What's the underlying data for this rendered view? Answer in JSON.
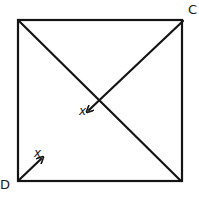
{
  "diagram": {
    "type": "square-with-diagonals",
    "vertices": {
      "top_left": {
        "label": "",
        "x": 18,
        "y": 20
      },
      "top_right": {
        "label": "C",
        "x": 183,
        "y": 20
      },
      "bottom_left": {
        "label": "D",
        "x": 18,
        "y": 181
      },
      "bottom_right": {
        "label": "",
        "x": 181,
        "y": 181
      }
    },
    "labels": {
      "C": "C",
      "D": "D",
      "vector_from_C": "x",
      "vector_from_D": "x"
    },
    "segments": [
      {
        "name": "full-diagonal",
        "from": "top_left",
        "to": "bottom_right"
      },
      {
        "name": "partial-diagonal-from-C",
        "from": "C",
        "to_point": [
          88,
          110
        ],
        "arrow": true
      },
      {
        "name": "short-vector-from-D",
        "from": "D",
        "to_point": [
          42,
          157
        ],
        "arrow": true
      }
    ],
    "stroke_color": "#141414"
  }
}
